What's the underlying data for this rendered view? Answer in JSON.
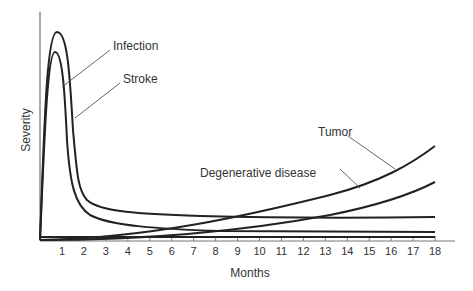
{
  "chart_data": {
    "type": "line",
    "title": "",
    "xlabel": "Months",
    "ylabel": "Severity",
    "xlim": [
      0,
      18.8
    ],
    "ylim": [
      0,
      1
    ],
    "grid": false,
    "legend_position": "inline labels with leader lines",
    "x_ticks": [
      "1",
      "2",
      "3",
      "4",
      "5",
      "6",
      "7",
      "8",
      "9",
      "10",
      "11",
      "12",
      "13",
      "14",
      "15",
      "16",
      "17",
      "18"
    ],
    "x": [
      0,
      0.25,
      0.5,
      0.75,
      1,
      1.25,
      1.5,
      1.75,
      2,
      2.5,
      3,
      4,
      5,
      6,
      7,
      8,
      9,
      10,
      11,
      12,
      13,
      14,
      15,
      16,
      17,
      18
    ],
    "series": [
      {
        "name": "Infection",
        "values": [
          0,
          0.7,
          0.9,
          0.95,
          0.92,
          0.8,
          0.6,
          0.42,
          0.29,
          0.22,
          0.19,
          0.16,
          0.14,
          0.13,
          0.12,
          0.115,
          0.11,
          0.105,
          0.1,
          0.1,
          0.1,
          0.1,
          0.1,
          0.1,
          0.1,
          0.1
        ]
      },
      {
        "name": "Stroke",
        "values": [
          0,
          0.6,
          0.82,
          0.87,
          0.8,
          0.62,
          0.42,
          0.28,
          0.18,
          0.12,
          0.09,
          0.06,
          0.045,
          0.035,
          0.03,
          0.025,
          0.02,
          0.02,
          0.02,
          0.02,
          0.02,
          0.02,
          0.02,
          0.02,
          0.02,
          0.02
        ]
      },
      {
        "name": "Tumor",
        "values": [
          0,
          0.002,
          0.004,
          0.006,
          0.008,
          0.01,
          0.012,
          0.015,
          0.018,
          0.024,
          0.03,
          0.045,
          0.06,
          0.077,
          0.096,
          0.117,
          0.14,
          0.165,
          0.19,
          0.22,
          0.25,
          0.28,
          0.32,
          0.36,
          0.4,
          0.45
        ]
      },
      {
        "name": "Degenerative disease",
        "values": [
          0,
          0.001,
          0.002,
          0.003,
          0.004,
          0.005,
          0.006,
          0.008,
          0.01,
          0.014,
          0.018,
          0.026,
          0.035,
          0.045,
          0.056,
          0.068,
          0.082,
          0.097,
          0.113,
          0.13,
          0.15,
          0.17,
          0.19,
          0.215,
          0.24,
          0.27
        ]
      }
    ],
    "annotations": [
      "Infection",
      "Stroke",
      "Tumor",
      "Degenerative disease"
    ]
  },
  "labels": {
    "infection": "Infection",
    "stroke": "Stroke",
    "tumor": "Tumor",
    "degenerative": "Degenerative disease",
    "xlabel": "Months",
    "ylabel": "Severity"
  },
  "colors": {
    "line": "#222222",
    "text": "#333333",
    "axis": "#555555"
  }
}
